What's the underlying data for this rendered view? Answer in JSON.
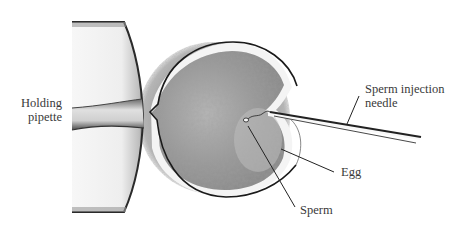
{
  "labels": {
    "holding_pipette": [
      "Holding",
      "pipette"
    ],
    "injection_needle": [
      "Sperm injection",
      "needle"
    ],
    "egg": "Egg",
    "sperm": "Sperm"
  },
  "colors": {
    "background": "#ffffff",
    "halo": "#8e8e8e",
    "egg_cytoplasm": "#8a8a8a",
    "membrane": "#1a1a1a",
    "pipette_glass": "#f2f2f2",
    "pipette_edge": "#2a2a2a",
    "leader_line": "#222222",
    "text": "#3a3a3a"
  }
}
